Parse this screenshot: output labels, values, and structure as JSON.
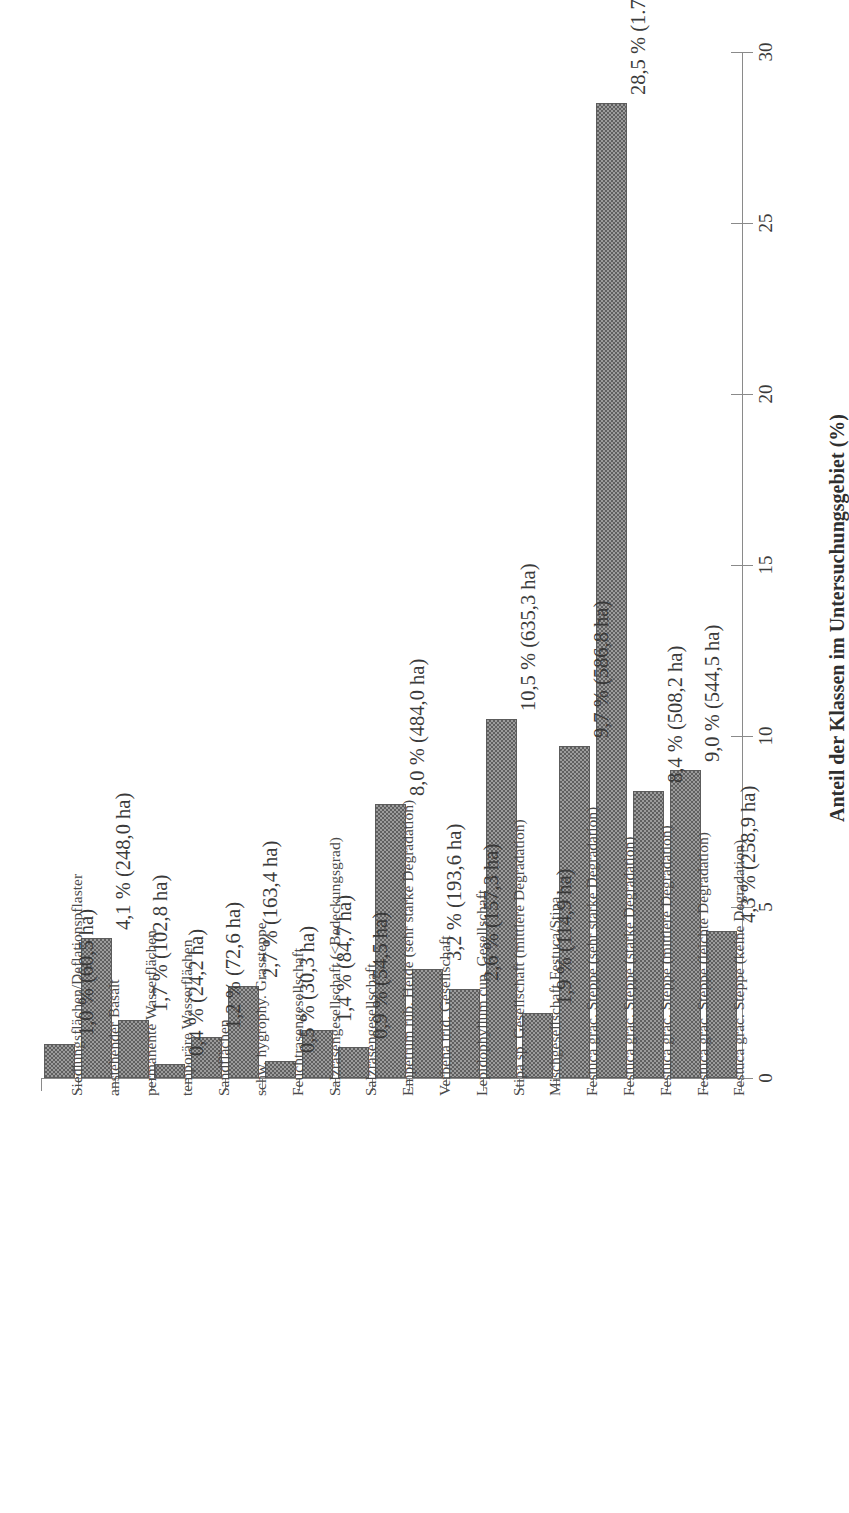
{
  "chart_data": {
    "type": "bar",
    "orientation": "rotated-vertical",
    "title": "",
    "xlabel": "",
    "ylabel": "Anteil der Klassen im Untersuchungsgebiet (%)",
    "ylim": [
      0,
      30
    ],
    "yticks": [
      0,
      5,
      10,
      15,
      20,
      25,
      30
    ],
    "ytick_labels": [
      "0",
      "5",
      "10",
      "15",
      "20",
      "25",
      "30"
    ],
    "grid": false,
    "legend": null,
    "bar_color": "#9b9b9b",
    "bar_edge_color": "#5c5c5c",
    "axis_color": "#8a8a8a",
    "categories": [
      "Siedlungsflächen/Deflationspflaster",
      "anstehender Basalt",
      "permanente Wasserflächen",
      "temporäre Wasserflächen",
      "Sandflächen",
      "schw. hygrophy. Grassteppe",
      "Feuchtrasengesellschaft",
      "Salzrasengesellschaft (<Bedeckungsgrad)",
      "Salzrasengesellschaft",
      "Empetrum rub. Heide (sehr starke Degradation)",
      "Verbena trid. Gesellschaft",
      "Lepidophyllum cup. Gesellschaft",
      "Stipa sp. Gesellschaft (mittlere Degradation)",
      "Mischgesellschaft Festuca/Stipa",
      "Festuca grac. Steppe (sehr starke Degradation)",
      "Festuca grac. Steppe (starke Degradation)",
      "Festuca grac. Steppe (mittlere Degradation)",
      "Festuca grac. Steppe (leichte Degradation)",
      "Festuca grac. Steppe (keine Degradation)"
    ],
    "values": [
      1.0,
      4.1,
      1.7,
      0.4,
      1.2,
      2.7,
      0.5,
      1.4,
      0.9,
      8.0,
      3.2,
      2.6,
      10.5,
      1.9,
      9.7,
      28.5,
      8.4,
      9.0,
      4.3
    ],
    "hectares": [
      60.5,
      248.0,
      102.8,
      24.2,
      72.6,
      163.4,
      30.3,
      84.7,
      54.5,
      484.0,
      193.6,
      157.3,
      635.3,
      114.9,
      586.8,
      1724.3,
      508.2,
      544.5,
      258.9
    ],
    "data_labels": [
      "1,0 % (60,5 ha)",
      "4,1 % (248,0 ha)",
      "1,7 % (102,8 ha)",
      "0,4 % (24,2 ha)",
      "1,2 % (72,6 ha)",
      "2,7 % (163,4 ha)",
      "0,5 % (30,3 ha)",
      "1,4 % (84,7 ha)",
      "0,9 % (54,5 ha)",
      "8,0 % (484,0 ha)",
      "3,2 % (193,6 ha)",
      "2,6 % (157,3 ha)",
      "10,5 % (635,3 ha)",
      "1,9 % (114,9 ha)",
      "9,7 % (586,8 ha)",
      "28,5 % (1.724,3 ha)",
      "8,4 % (508,2 ha)",
      "9,0 % (544,5 ha)",
      "4,3 % (258,9 ha)"
    ]
  }
}
